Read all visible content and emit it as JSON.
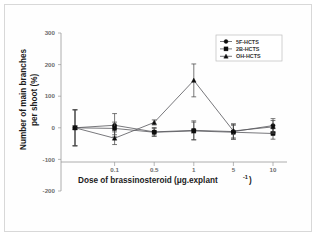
{
  "figure": {
    "background_color": "#ffffff",
    "frame_color": "#d8d8d8"
  },
  "chart_data": {
    "type": "line",
    "title": "",
    "subtitle": "",
    "xlabel": "Dose of brassinosteroid (μg.explant",
    "xlabel_exponent": "-1",
    "xlabel_close": ")",
    "ylabel_line1": "Number of main branches",
    "ylabel_line2": "per shoot (%)",
    "categories": [
      "0",
      "0.1",
      "0.5",
      "1",
      "5",
      "10"
    ],
    "xtick_labels": [
      "",
      "0.1",
      "0.5",
      "1",
      "5",
      "10"
    ],
    "ytick_labels": [
      "300",
      "200",
      "100",
      "0",
      "-100",
      "-200"
    ],
    "yticks": [
      300,
      200,
      100,
      0,
      -100,
      -200
    ],
    "ylim": [
      -200,
      300
    ],
    "grid": false,
    "legend_position": "top-right",
    "marker_color": "#0d0d0d",
    "line_color": "#55555a",
    "series": [
      {
        "name": "5F-HCTS",
        "marker": "circle",
        "values": [
          0,
          8,
          -13,
          -8,
          -12,
          7
        ],
        "errors": [
          57,
          37,
          14,
          30,
          24,
          22
        ]
      },
      {
        "name": "2B-HCTS",
        "marker": "square",
        "values": [
          0,
          -2,
          -14,
          -10,
          -14,
          -18
        ],
        "errors": [
          57,
          20,
          12,
          28,
          22,
          18
        ]
      },
      {
        "name": "OH-HCTS",
        "marker": "triangle",
        "values": [
          0,
          -33,
          17,
          150,
          -10,
          3
        ],
        "errors": [
          57,
          20,
          8,
          52,
          22,
          20
        ]
      }
    ]
  }
}
